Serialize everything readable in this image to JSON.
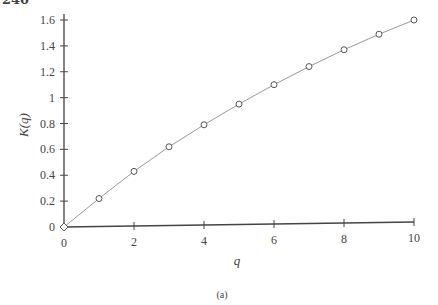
{
  "page": {
    "number": "240"
  },
  "chart_data": {
    "type": "line",
    "title": "",
    "caption": "(a)",
    "xlabel": "q",
    "ylabel": "K(q)",
    "xlim": [
      0,
      10
    ],
    "ylim": [
      0,
      1.6
    ],
    "grid": false,
    "legend": null,
    "x_ticks": [
      "0",
      "2",
      "4",
      "6",
      "8",
      "10"
    ],
    "y_ticks": [
      "0",
      "0.2",
      "0.4",
      "0.6",
      "0.8",
      "1",
      "1.2",
      "1.4",
      "1.6"
    ],
    "marker": "open-circle",
    "line_color": "#999999",
    "axis_color": "#444444",
    "x": [
      0,
      1,
      2,
      3,
      4,
      5,
      6,
      7,
      8,
      9,
      10
    ],
    "series": [
      {
        "name": "K(q)",
        "values": [
          0,
          0.22,
          0.43,
          0.62,
          0.79,
          0.95,
          1.1,
          1.24,
          1.37,
          1.49,
          1.6
        ]
      }
    ]
  }
}
